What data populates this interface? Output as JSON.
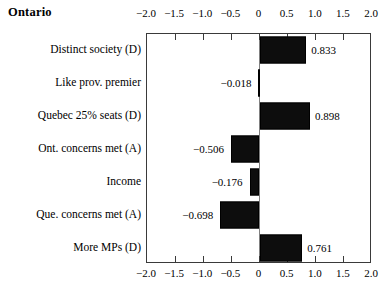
{
  "chart_data": {
    "type": "bar",
    "orientation": "horizontal",
    "title": "Ontario",
    "xlabel": "",
    "ylabel": "",
    "xlim": [
      -2.0,
      2.0
    ],
    "grid": false,
    "legend": null,
    "axis_positions": [
      "top",
      "bottom"
    ],
    "bar_color": "#0d0d0d",
    "zero_line_color": "#808080",
    "axis_color": "#3a3a3a",
    "tick_values": [
      -2.0,
      -1.5,
      -1.0,
      -0.5,
      0,
      0.5,
      1.0,
      1.5,
      2.0
    ],
    "tick_labels": [
      "-2.0",
      "-1.5",
      "-1.0",
      "-0.5",
      "0",
      "0.5",
      "1.0",
      "1.5",
      "2.0"
    ],
    "categories": [
      "Distinct society (D)",
      "Like prov. premier",
      "Quebec 25% seats (D)",
      "Ont. concerns met (A)",
      "Income",
      "Que. concerns met (A)",
      "More MPs (D)"
    ],
    "values": [
      0.833,
      -0.018,
      0.898,
      -0.506,
      -0.176,
      -0.698,
      0.761
    ],
    "value_labels": [
      "0.833",
      "-0.018",
      "0.898",
      "-0.506",
      "-0.176",
      "-0.698",
      "0.761"
    ]
  }
}
